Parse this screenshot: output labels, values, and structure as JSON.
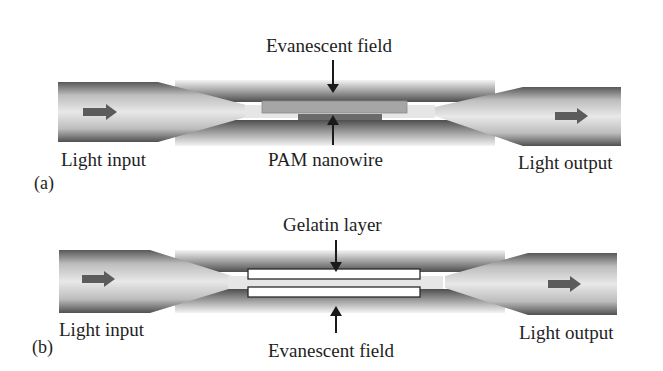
{
  "figure": {
    "panel_a": {
      "panel_label": "(a)",
      "top_label": "Evanescent field",
      "bottom_label": "PAM nanowire",
      "input_label": "Light input",
      "output_label": "Light output",
      "elements": {
        "nanowire": "PAM nanowire",
        "field": "Evanescent field"
      }
    },
    "panel_b": {
      "panel_label": "(b)",
      "top_label": "Gelatin layer",
      "bottom_label": "Evanescent field",
      "input_label": "Light input",
      "output_label": "Light output",
      "elements": {
        "layer": "Gelatin layer",
        "field": "Evanescent field"
      }
    },
    "colors": {
      "fiber_dark": "#5a5a5a",
      "fiber_light": "#e4e4e4",
      "arrow": "#5c5c5c",
      "nanowire": "#a8a8a8",
      "nanowire_dark": "#6a6a6a",
      "gelatin_fill": "#ffffff",
      "gelatin_stroke": "#2a2a2a",
      "text": "#1e1e1e"
    }
  }
}
